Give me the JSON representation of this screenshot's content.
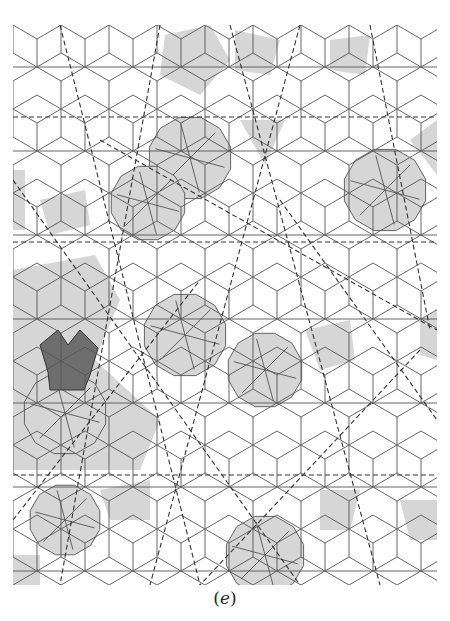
{
  "figure": {
    "caption_open": "(",
    "caption_letter": "e",
    "caption_close": ")",
    "bounds": {
      "x": 13,
      "y": 25,
      "width": 424,
      "height": 560
    },
    "colors": {
      "edge": "#555555",
      "shade_light": "#d6d6d6",
      "shade_dark": "#6e6e6e",
      "dashed_line": "#333333",
      "background": "#ffffff"
    },
    "horizontal_dashed_lines_y": [
      117,
      242,
      475
    ],
    "diagonal_dashed_lines": [
      [
        60,
        25,
        200,
        585
      ],
      [
        160,
        25,
        60,
        585
      ],
      [
        230,
        25,
        380,
        585
      ],
      [
        300,
        25,
        150,
        585
      ],
      [
        370,
        25,
        430,
        330
      ],
      [
        100,
        140,
        437,
        330
      ],
      [
        13,
        180,
        300,
        585
      ],
      [
        420,
        350,
        200,
        585
      ],
      [
        13,
        520,
        200,
        280
      ],
      [
        280,
        200,
        437,
        420
      ]
    ],
    "shaded_dodecagons": [
      {
        "cx": 190,
        "cy": 158,
        "r": 42
      },
      {
        "cx": 385,
        "cy": 190,
        "r": 42
      },
      {
        "cx": 148,
        "cy": 203,
        "r": 38
      },
      {
        "cx": 185,
        "cy": 335,
        "r": 42
      },
      {
        "cx": 65,
        "cy": 413,
        "r": 42
      },
      {
        "cx": 265,
        "cy": 370,
        "r": 38
      },
      {
        "cx": 65,
        "cy": 520,
        "r": 36
      },
      {
        "cx": 265,
        "cy": 555,
        "r": 40
      }
    ],
    "shaded_light_polys": [
      [
        [
          165,
          35
        ],
        [
          210,
          25
        ],
        [
          230,
          60
        ],
        [
          200,
          95
        ],
        [
          160,
          75
        ]
      ],
      [
        [
          235,
          30
        ],
        [
          280,
          40
        ],
        [
          270,
          75
        ],
        [
          235,
          70
        ]
      ],
      [
        [
          330,
          40
        ],
        [
          370,
          35
        ],
        [
          365,
          75
        ],
        [
          330,
          70
        ]
      ],
      [
        [
          13,
          170
        ],
        [
          25,
          170
        ],
        [
          25,
          230
        ],
        [
          13,
          230
        ]
      ],
      [
        [
          40,
          200
        ],
        [
          85,
          190
        ],
        [
          90,
          225
        ],
        [
          50,
          235
        ]
      ],
      [
        [
          13,
          270
        ],
        [
          95,
          255
        ],
        [
          120,
          300
        ],
        [
          95,
          360
        ],
        [
          160,
          420
        ],
        [
          140,
          470
        ],
        [
          13,
          470
        ]
      ],
      [
        [
          240,
          120
        ],
        [
          285,
          120
        ],
        [
          265,
          165
        ]
      ],
      [
        [
          410,
          140
        ],
        [
          437,
          120
        ],
        [
          437,
          175
        ]
      ],
      [
        [
          305,
          330
        ],
        [
          350,
          320
        ],
        [
          355,
          360
        ],
        [
          320,
          370
        ]
      ],
      [
        [
          420,
          320
        ],
        [
          437,
          310
        ],
        [
          437,
          360
        ],
        [
          420,
          355
        ]
      ],
      [
        [
          100,
          490
        ],
        [
          150,
          480
        ],
        [
          150,
          520
        ],
        [
          110,
          520
        ]
      ],
      [
        [
          320,
          490
        ],
        [
          360,
          490
        ],
        [
          350,
          530
        ],
        [
          320,
          530
        ]
      ],
      [
        [
          400,
          500
        ],
        [
          437,
          500
        ],
        [
          437,
          540
        ],
        [
          410,
          540
        ]
      ],
      [
        [
          13,
          555
        ],
        [
          40,
          555
        ],
        [
          40,
          585
        ],
        [
          13,
          585
        ]
      ]
    ],
    "dark_star": [
      [
        40,
        345
      ],
      [
        58,
        330
      ],
      [
        68,
        345
      ],
      [
        80,
        330
      ],
      [
        98,
        348
      ],
      [
        90,
        375
      ],
      [
        84,
        390
      ],
      [
        50,
        390
      ],
      [
        48,
        372
      ]
    ]
  }
}
